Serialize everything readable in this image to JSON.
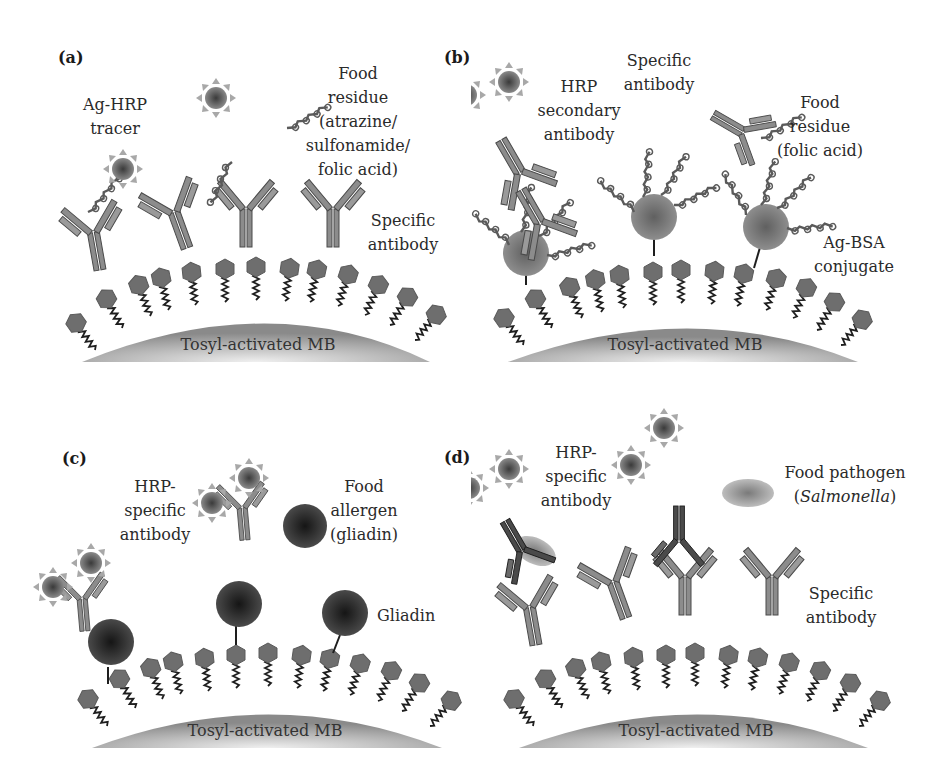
{
  "figure": {
    "panels": [
      {
        "id": "a",
        "panel_label": "(a)",
        "bead_label": "Tosyl-activated MB",
        "labels": {
          "tracer": [
            "Ag-HRP",
            "tracer"
          ],
          "residue": [
            "Food",
            "residue",
            "(atrazine/",
            "sulfonamide/",
            "folic acid)"
          ],
          "antibody": [
            "Specific",
            "antibody"
          ]
        }
      },
      {
        "id": "b",
        "panel_label": "(b)",
        "bead_label": "Tosyl-activated MB",
        "labels": {
          "secondary": [
            "HRP",
            "secondary",
            "antibody"
          ],
          "specific": [
            "Specific",
            "antibody"
          ],
          "residue": [
            "Food",
            "residue",
            "(folic acid)"
          ],
          "conjugate": [
            "Ag-BSA",
            "conjugate"
          ]
        }
      },
      {
        "id": "c",
        "panel_label": "(c)",
        "bead_label": "Tosyl-activated MB",
        "labels": {
          "hrp": [
            "HRP-",
            "specific",
            "antibody"
          ],
          "allergen": [
            "Food",
            "allergen",
            "(gliadin)"
          ],
          "gliadin": [
            "Gliadin"
          ]
        }
      },
      {
        "id": "d",
        "panel_label": "(d)",
        "bead_label": "Tosyl-activated MB",
        "labels": {
          "hrp": [
            "HRP-",
            "specific",
            "antibody"
          ],
          "pathogen_line1": "Food pathogen",
          "pathogen_open": "(",
          "pathogen_name": "Salmonella",
          "pathogen_close": ")",
          "antibody": [
            "Specific",
            "antibody"
          ]
        }
      }
    ],
    "colors": {
      "bead_dark": "#8a8a8a",
      "bead_light": "#e8e8e8",
      "hexagon": "#6e6e6e",
      "antibody": "#8c8c8c",
      "antibody_dark": "#4a4a4a",
      "gliadin": "#2e2e2e",
      "hrp_core": "#5a5a5a",
      "hrp_rays": "#a0a0a0",
      "text": "#2a2a2a"
    }
  }
}
